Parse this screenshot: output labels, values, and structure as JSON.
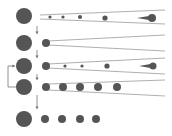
{
  "diagram": {
    "colors": {
      "node": "#555555",
      "line": "#9a9a9a",
      "arrow": "#777777",
      "background": "#ffffff"
    },
    "rows": [
      {
        "id": "row-1",
        "source": {
          "x": 24,
          "y": 16,
          "r": 8
        },
        "cone": {
          "x0": 40,
          "y_top0": 15,
          "y_bot0": 19,
          "x1": 165,
          "y_top1": 10,
          "y_bot1": 24
        },
        "dots": [
          {
            "x": 50,
            "y": 17,
            "r": 1.6
          },
          {
            "x": 63,
            "y": 17,
            "r": 1.6
          },
          {
            "x": 80,
            "y": 17,
            "r": 2
          },
          {
            "x": 105,
            "y": 18,
            "r": 2.6
          }
        ],
        "projectile": {
          "x": 152,
          "y": 18,
          "r": 4,
          "tail_x": 137
        }
      },
      {
        "id": "row-2",
        "source": {
          "x": 24,
          "y": 43,
          "r": 8
        },
        "cone": {
          "x0": 48,
          "y_top0": 41,
          "y_bot0": 45,
          "x1": 165,
          "y_top1": 35,
          "y_bot1": 51
        },
        "dots": [
          {
            "x": 46,
            "y": 43,
            "r": 4
          }
        ],
        "projectile": null
      },
      {
        "id": "row-3",
        "source": {
          "x": 24,
          "y": 66,
          "r": 8
        },
        "cone": {
          "x0": 48,
          "y_top0": 64,
          "y_bot0": 68,
          "x1": 165,
          "y_top1": 58,
          "y_bot1": 74
        },
        "dots": [
          {
            "x": 46,
            "y": 66,
            "r": 4
          },
          {
            "x": 65,
            "y": 66,
            "r": 1.6
          },
          {
            "x": 82,
            "y": 66,
            "r": 1.6
          },
          {
            "x": 107,
            "y": 66,
            "r": 2.6
          }
        ],
        "projectile": {
          "x": 153,
          "y": 66,
          "r": 3.5,
          "tail_x": 139
        }
      },
      {
        "id": "row-4",
        "source": {
          "x": 24,
          "y": 87,
          "r": 8
        },
        "cone": {
          "x0": 48,
          "y_top0": 84,
          "y_bot0": 90,
          "x1": 165,
          "y_top1": 80,
          "y_bot1": 96
        },
        "dots": [
          {
            "x": 46,
            "y": 87,
            "r": 4
          },
          {
            "x": 63,
            "y": 87,
            "r": 4
          },
          {
            "x": 80,
            "y": 87,
            "r": 4
          },
          {
            "x": 98,
            "y": 87,
            "r": 4
          },
          {
            "x": 117,
            "y": 87,
            "r": 4
          }
        ],
        "projectile": null
      },
      {
        "id": "row-5",
        "source": {
          "x": 24,
          "y": 119,
          "r": 8
        },
        "cone": null,
        "dots": [
          {
            "x": 45,
            "y": 119,
            "r": 4
          },
          {
            "x": 62,
            "y": 119,
            "r": 4
          },
          {
            "x": 80,
            "y": 119,
            "r": 4
          },
          {
            "x": 96,
            "y": 119,
            "r": 4
          }
        ],
        "projectile": null
      }
    ],
    "down_arrows": [
      {
        "x": 37,
        "y0": 26,
        "y1": 33
      },
      {
        "x": 37,
        "y0": 50,
        "y1": 57
      },
      {
        "x": 37,
        "y0": 74,
        "y1": 79
      },
      {
        "x": 37,
        "y0": 95,
        "y1": 108
      }
    ],
    "feedback_arrow": {
      "x_left": 8,
      "y_from": 87,
      "y_to": 66,
      "x_target": 15
    }
  }
}
